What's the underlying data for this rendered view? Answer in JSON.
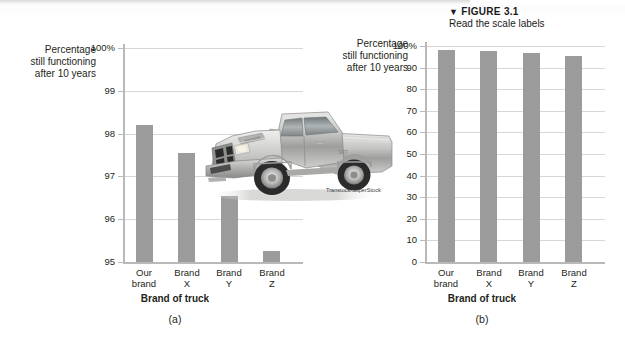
{
  "figure": {
    "marker": "▼",
    "number": "FIGURE 3.1",
    "caption": "Read the scale labels"
  },
  "photo": {
    "alt_name": "pickup-truck-photo",
    "credit": "Transtock/SuperStock"
  },
  "panel_a": {
    "letter": "(a)",
    "y_axis_title": [
      "Percentage",
      "still functioning",
      "after 10 years"
    ],
    "x_axis_title": "Brand of truck",
    "y_ticks": [
      "100%",
      "99",
      "98",
      "97",
      "96",
      "95"
    ],
    "categories": [
      [
        "Our",
        "brand"
      ],
      [
        "Brand",
        "X"
      ],
      [
        "Brand",
        "Y"
      ],
      [
        "Brand",
        "Z"
      ]
    ]
  },
  "panel_b": {
    "letter": "(b)",
    "y_axis_title": [
      "Percentage",
      "still functioning",
      "after 10 years"
    ],
    "x_axis_title": "Brand of truck",
    "y_ticks": [
      "100%",
      "90",
      "80",
      "70",
      "60",
      "50",
      "40",
      "30",
      "20",
      "10",
      "0"
    ],
    "categories": [
      [
        "Our",
        "brand"
      ],
      [
        "Brand",
        "X"
      ],
      [
        "Brand",
        "Y"
      ],
      [
        "Brand",
        "Z"
      ]
    ]
  },
  "colors": {
    "bar_fill": "#9b9b9b",
    "axis": "#b9b9b9",
    "gridline": "#d7d7d7",
    "text": "#231f20"
  },
  "chart_data": [
    {
      "type": "bar",
      "id": "panel-a",
      "title": "",
      "xlabel": "Brand of truck",
      "ylabel": "Percentage still functioning after 10 years",
      "categories": [
        "Our brand",
        "Brand X",
        "Brand Y",
        "Brand Z"
      ],
      "values": [
        98.2,
        97.55,
        96.55,
        95.25
      ],
      "ylim": [
        95,
        100
      ],
      "yticks": [
        95,
        96,
        97,
        98,
        99,
        100
      ],
      "ytick_labels": [
        "95",
        "96",
        "97",
        "98",
        "99",
        "100%"
      ],
      "grid": true,
      "legend": "none",
      "note": "Truncated vertical scale exaggerates the differences between brands."
    },
    {
      "type": "bar",
      "id": "panel-b",
      "title": "",
      "xlabel": "Brand of truck",
      "ylabel": "Percentage still functioning after 10 years",
      "categories": [
        "Our brand",
        "Brand X",
        "Brand Y",
        "Brand Z"
      ],
      "values": [
        98.2,
        97.55,
        96.55,
        95.25
      ],
      "ylim": [
        0,
        100
      ],
      "yticks": [
        0,
        10,
        20,
        30,
        40,
        50,
        60,
        70,
        80,
        90,
        100
      ],
      "ytick_labels": [
        "0",
        "10",
        "20",
        "30",
        "40",
        "50",
        "60",
        "70",
        "80",
        "90",
        "100%"
      ],
      "grid": true,
      "legend": "none",
      "note": "Full 0-100 scale shows the four brands are nearly identical."
    }
  ]
}
